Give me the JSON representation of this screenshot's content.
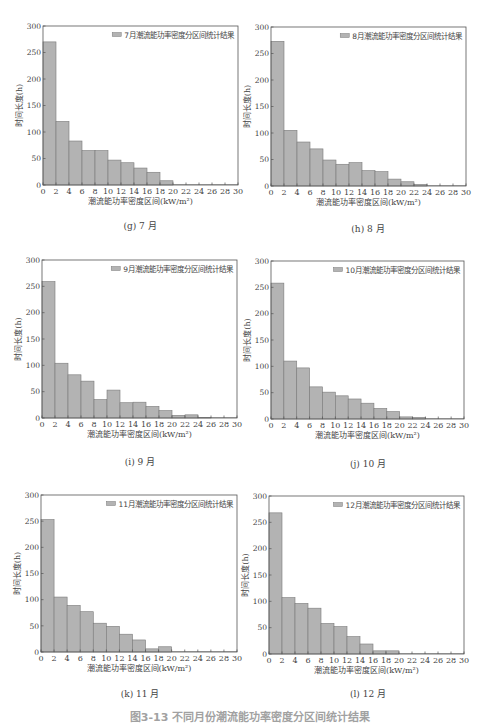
{
  "colors": {
    "bar_fill": "#b3b3b3",
    "bar_stroke": "#7a7a7a",
    "axis": "#555555",
    "text": "#444444"
  },
  "chart_data": [
    {
      "type": "bar",
      "id": "g",
      "legend": "7月潮流能功率密度分区间统计结果",
      "caption": "(g) 7 月",
      "xlabel": "潮流能功率密度区间(kW/m²)",
      "ylabel": "时间长度(h)",
      "xlim": [
        0,
        30
      ],
      "ylim": [
        0,
        300
      ],
      "xticks": [
        "0",
        "2",
        "4",
        "6",
        "8",
        "10",
        "12",
        "14",
        "16",
        "18",
        "20",
        "22",
        "24",
        "26",
        "28",
        "30"
      ],
      "yticks": [
        "0",
        "50",
        "100",
        "150",
        "200",
        "250",
        "300"
      ],
      "bin_edges_start": [
        0,
        2,
        4,
        6,
        8,
        10,
        12,
        14,
        16,
        18,
        20,
        22,
        24,
        26,
        28
      ],
      "values": [
        270,
        120,
        83,
        65,
        65,
        47,
        42,
        32,
        24,
        8,
        0,
        0,
        0,
        0,
        0
      ]
    },
    {
      "type": "bar",
      "id": "h",
      "legend": "8月潮流能功率密度分区间统计结果",
      "caption": "(h) 8 月",
      "xlabel": "潮流能功率密度区间(kW/m²)",
      "ylabel": "时间长度(h)",
      "xlim": [
        0,
        30
      ],
      "ylim": [
        0,
        300
      ],
      "xticks": [
        "0",
        "2",
        "4",
        "6",
        "8",
        "10",
        "12",
        "14",
        "16",
        "18",
        "20",
        "22",
        "24",
        "26",
        "28",
        "30"
      ],
      "yticks": [
        "0",
        "50",
        "100",
        "150",
        "200",
        "250",
        "300"
      ],
      "bin_edges_start": [
        0,
        2,
        4,
        6,
        8,
        10,
        12,
        14,
        16,
        18,
        20,
        22,
        24,
        26,
        28
      ],
      "values": [
        273,
        105,
        83,
        70,
        49,
        41,
        44,
        29,
        27,
        13,
        8,
        3,
        0,
        0,
        0
      ]
    },
    {
      "type": "bar",
      "id": "i",
      "legend": "9月潮流能功率密度分区间统计结果",
      "caption": "(i) 9 月",
      "xlabel": "潮流能功率密度区间(kW/m²)",
      "ylabel": "时间长度(h)",
      "xlim": [
        0,
        30
      ],
      "ylim": [
        0,
        300
      ],
      "xticks": [
        "0",
        "2",
        "4",
        "6",
        "8",
        "10",
        "12",
        "14",
        "16",
        "18",
        "20",
        "22",
        "24",
        "26",
        "28",
        "30"
      ],
      "yticks": [
        "0",
        "50",
        "100",
        "150",
        "200",
        "250",
        "300"
      ],
      "bin_edges_start": [
        0,
        2,
        4,
        6,
        8,
        10,
        12,
        14,
        16,
        18,
        20,
        22,
        24,
        26,
        28
      ],
      "values": [
        259,
        104,
        82,
        70,
        35,
        53,
        29,
        30,
        22,
        14,
        5,
        6,
        1,
        0,
        0
      ]
    },
    {
      "type": "bar",
      "id": "j",
      "legend": "10月潮流能功率密度分区间统计结果",
      "caption": "(j) 10 月",
      "xlabel": "潮流能功率密度区间(kW/m²)",
      "ylabel": "时间长度(h)",
      "xlim": [
        0,
        30
      ],
      "ylim": [
        0,
        300
      ],
      "xticks": [
        "0",
        "2",
        "4",
        "6",
        "8",
        "10",
        "12",
        "14",
        "16",
        "18",
        "20",
        "22",
        "24",
        "26",
        "28",
        "30"
      ],
      "yticks": [
        "0",
        "50",
        "100",
        "150",
        "200",
        "250",
        "300"
      ],
      "bin_edges_start": [
        0,
        2,
        4,
        6,
        8,
        10,
        12,
        14,
        16,
        18,
        20,
        22,
        24,
        26,
        28
      ],
      "values": [
        258,
        110,
        97,
        61,
        51,
        44,
        38,
        30,
        20,
        14,
        4,
        3,
        0,
        0,
        0
      ]
    },
    {
      "type": "bar",
      "id": "k",
      "legend": "11月潮流能功率密度分区间统计结果",
      "caption": "(k) 11 月",
      "xlabel": "潮流能功率密度区间(kW/m²)",
      "ylabel": "时间长度(h)",
      "xlim": [
        0,
        30
      ],
      "ylim": [
        0,
        300
      ],
      "xticks": [
        "0",
        "2",
        "4",
        "6",
        "8",
        "10",
        "12",
        "14",
        "16",
        "18",
        "20",
        "22",
        "24",
        "26",
        "28",
        "30"
      ],
      "yticks": [
        "0",
        "50",
        "100",
        "150",
        "200",
        "250",
        "300"
      ],
      "bin_edges_start": [
        0,
        2,
        4,
        6,
        8,
        10,
        12,
        14,
        16,
        18,
        20,
        22,
        24,
        26,
        28
      ],
      "values": [
        253,
        105,
        89,
        77,
        55,
        49,
        34,
        23,
        6,
        10,
        0,
        0,
        0,
        0,
        0
      ]
    },
    {
      "type": "bar",
      "id": "l",
      "legend": "12月潮流能功率密度分区间统计结果",
      "caption": "(l) 12 月",
      "xlabel": "潮流能功率密度区间(kW/m²)",
      "ylabel": "时间长度(h)",
      "xlim": [
        0,
        30
      ],
      "ylim": [
        0,
        300
      ],
      "xticks": [
        "0",
        "2",
        "4",
        "6",
        "8",
        "10",
        "12",
        "14",
        "16",
        "18",
        "20",
        "22",
        "24",
        "26",
        "28",
        "30"
      ],
      "yticks": [
        "0",
        "50",
        "100",
        "150",
        "200",
        "250",
        "300"
      ],
      "bin_edges_start": [
        0,
        2,
        4,
        6,
        8,
        10,
        12,
        14,
        16,
        18,
        20,
        22,
        24,
        26,
        28
      ],
      "values": [
        268,
        107,
        96,
        87,
        58,
        52,
        33,
        19,
        6,
        6,
        0,
        0,
        0,
        0,
        0
      ]
    }
  ],
  "figure_caption": "图3-13  不同月份潮流能功率密度分区间统计结果"
}
